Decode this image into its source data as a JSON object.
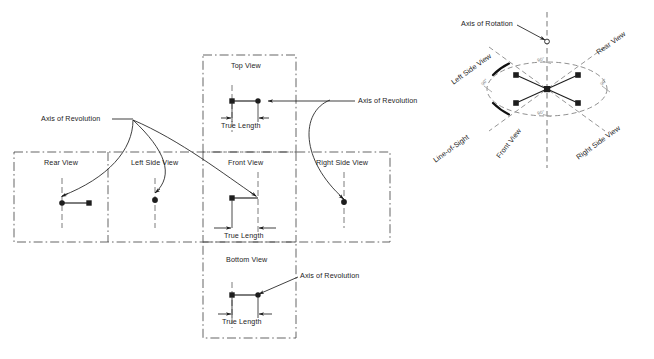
{
  "figure": {
    "type": "orthographic-projection-technical-drawing",
    "title_implicit": "True length by revolution - six principal views with pictorial rotation diagram",
    "colors": {
      "line": "#1d1d1d",
      "chain_line": "#4a4a4a",
      "construction": "#8a8a8a",
      "background": "#ffffff",
      "text": "#1d1d1a"
    }
  },
  "orthographic": {
    "views": [
      {
        "id": "top",
        "label": "Top View",
        "x": 249,
        "y": 68,
        "marker_left": "square",
        "marker_right": "dot"
      },
      {
        "id": "rear",
        "label": "Rear View",
        "x": 62,
        "y": 165,
        "marker_left": "dot",
        "marker_right": "square"
      },
      {
        "id": "left_side",
        "label": "Left Side View",
        "x": 155,
        "y": 165,
        "marker_left": "dot",
        "marker_right": "none"
      },
      {
        "id": "front",
        "label": "Front View",
        "x": 249,
        "y": 165,
        "marker_left": "square",
        "marker_right": "dot"
      },
      {
        "id": "right_side",
        "label": "Right Side View",
        "x": 344,
        "y": 165,
        "marker_left": "dot",
        "marker_right": "none"
      },
      {
        "id": "bottom",
        "label": "Bottom View",
        "x": 249,
        "y": 262,
        "marker_left": "square",
        "marker_right": "dot"
      }
    ],
    "dimensions": [
      {
        "id": "tl-top",
        "label": "True Length",
        "view": "top"
      },
      {
        "id": "tl-front",
        "label": "True Length",
        "view": "front"
      },
      {
        "id": "tl-bottom",
        "label": "True Length",
        "view": "bottom"
      }
    ],
    "annotations": [
      {
        "id": "aor-left",
        "label": "Axis of Revolution",
        "anchor": "top-left-curves"
      },
      {
        "id": "aor-right",
        "label": "Axis of Revolution",
        "anchor": "right-side-curve"
      },
      {
        "id": "aor-bottom",
        "label": "Axis of Revolution",
        "anchor": "bottom-view-point"
      }
    ]
  },
  "pictorial": {
    "axis_label": "Axis of Rotation",
    "line_of_sight_label": "Line-of-Sight",
    "view_labels": [
      {
        "id": "left-side",
        "label": "Left Side View",
        "position": "upper-left"
      },
      {
        "id": "rear",
        "label": "Rear View",
        "position": "upper-right"
      },
      {
        "id": "front",
        "label": "Front View",
        "position": "lower-left"
      },
      {
        "id": "right-side",
        "label": "Right Side View",
        "position": "lower-right"
      }
    ],
    "angle_labels": [
      {
        "id": "ang-top",
        "label": "90°",
        "position": "top"
      },
      {
        "id": "ang-left",
        "label": "90°",
        "position": "left"
      },
      {
        "id": "ang-right",
        "label": "90°",
        "position": "right"
      },
      {
        "id": "ang-bottom",
        "label": "90°",
        "position": "bottom"
      }
    ],
    "markers": {
      "center": "square",
      "outer_count": 4,
      "outer_shape": "square"
    }
  }
}
